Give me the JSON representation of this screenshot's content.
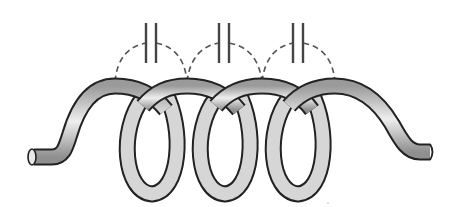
{
  "diagram": {
    "title": "Coil with inter-turn parasitic capacitance",
    "coil": {
      "turns": 4,
      "loops": 3,
      "tube_fill": "#d9d9d9",
      "tube_outline": "#222222",
      "left_end": {
        "x": 30,
        "y": 157
      },
      "right_end": {
        "x": 432,
        "y": 152
      }
    },
    "capacitors": [
      {
        "label": "C1",
        "x": 151,
        "from_turn": 1,
        "to_turn": 2
      },
      {
        "label": "C2",
        "x": 224,
        "from_turn": 2,
        "to_turn": 3
      },
      {
        "label": "C3",
        "x": 298,
        "from_turn": 3,
        "to_turn": 4
      }
    ],
    "connection_style": "dashed",
    "colors": {
      "line": "#444444",
      "dash": "#555555",
      "background": "#ffffff"
    }
  }
}
